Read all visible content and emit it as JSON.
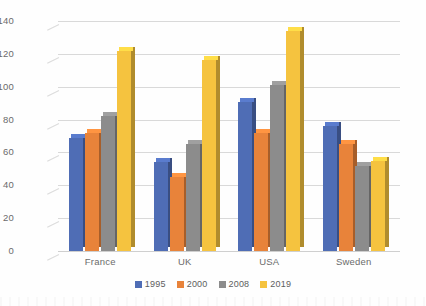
{
  "chart_data": {
    "type": "bar",
    "title": "",
    "subtitle": "",
    "xlabel": "",
    "ylabel": "",
    "categories": [
      "France",
      "UK",
      "USA",
      "Sweden"
    ],
    "series": [
      {
        "name": "1995",
        "color": "#4f6db5",
        "values": [
          69,
          54,
          91,
          76
        ]
      },
      {
        "name": "2000",
        "color": "#e8833a",
        "values": [
          72,
          45,
          72,
          65
        ]
      },
      {
        "name": "2008",
        "color": "#8c8c8c",
        "values": [
          82,
          65,
          101,
          52
        ]
      },
      {
        "name": "2019",
        "color": "#f5c33f",
        "values": [
          122,
          116,
          134,
          55
        ]
      }
    ],
    "ylim": [
      0,
      140
    ],
    "ytick_step": 20,
    "yticks": [
      0,
      20,
      40,
      60,
      80,
      100,
      120,
      140
    ],
    "grid": true,
    "legend_position": "bottom",
    "three_d": true
  },
  "axes": {
    "y_tick_labels": [
      "140",
      "120",
      "100",
      "80",
      "60",
      "40",
      "20",
      "0"
    ],
    "x_tick_labels": [
      "France",
      "UK",
      "USA",
      "Sweden"
    ]
  },
  "legend": {
    "entries": [
      {
        "label": "1995",
        "color": "#4f6db5"
      },
      {
        "label": "2000",
        "color": "#e8833a"
      },
      {
        "label": "2008",
        "color": "#8c8c8c"
      },
      {
        "label": "2019",
        "color": "#f5c33f"
      }
    ]
  }
}
